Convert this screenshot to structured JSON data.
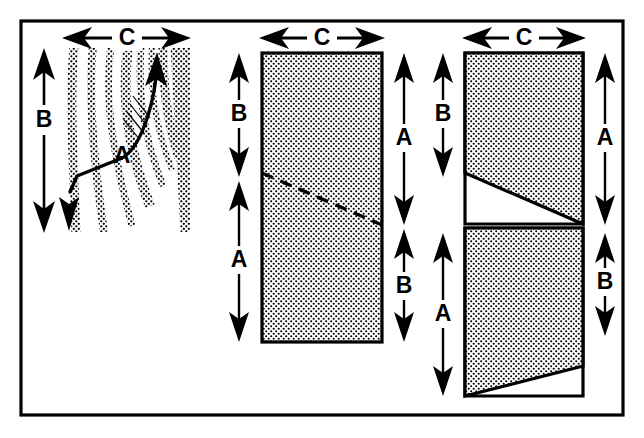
{
  "figure": {
    "title": "",
    "frame": {
      "stroke_color": "#000000",
      "fill_color": "#ffffff"
    },
    "colors": {
      "ink": "#000000",
      "paper": "#ffffff",
      "stipple": "#000000",
      "stipple_bg": "#ffffff"
    },
    "panels": [
      {
        "id": "panel-1",
        "name": "log-cross-section",
        "description": "Stippled end-grain texture of a log with a curved arrow indicating ray/grain direction",
        "labels": {
          "width_dimension": "C",
          "height_dimension": "B",
          "callout": "A"
        },
        "dimension_arrows": [
          {
            "name": "width-arrow-c",
            "label": "C",
            "orientation": "horizontal",
            "heads": "both"
          },
          {
            "name": "height-arrow-b",
            "label": "B",
            "orientation": "vertical",
            "heads": "both"
          }
        ],
        "grain_arrow": {
          "name": "grain-arrow-a",
          "label": "A",
          "style": "curved",
          "heads": "end"
        }
      },
      {
        "id": "panel-2",
        "name": "single-board-dashed-split",
        "description": "One stippled rectangle with a dashed diagonal split line",
        "labels": {
          "width_dimension": "C",
          "left_top": "B",
          "left_bottom": "A",
          "right_top": "A",
          "right_bottom": "B"
        },
        "split_line_style": "dashed",
        "dimension_arrows": [
          {
            "name": "width-arrow-c",
            "label": "C",
            "orientation": "horizontal",
            "heads": "both"
          },
          {
            "name": "left-arrow-b",
            "label": "B",
            "orientation": "vertical",
            "heads": "both"
          },
          {
            "name": "left-arrow-a",
            "label": "A",
            "orientation": "vertical",
            "heads": "both"
          },
          {
            "name": "right-arrow-a",
            "label": "A",
            "orientation": "vertical",
            "heads": "both"
          },
          {
            "name": "right-arrow-b",
            "label": "B",
            "orientation": "vertical",
            "heads": "both"
          }
        ]
      },
      {
        "id": "panel-3",
        "name": "two-boards-solid-split",
        "description": "Two stacked stippled trapezoids separated by solid diagonal cuts",
        "labels": {
          "width_dimension": "C",
          "left_top": "B",
          "left_bottom": "A",
          "right_top": "A",
          "right_bottom": "B"
        },
        "split_line_style": "solid",
        "dimension_arrows": [
          {
            "name": "width-arrow-c",
            "label": "C",
            "orientation": "horizontal",
            "heads": "both"
          },
          {
            "name": "left-arrow-b",
            "label": "B",
            "orientation": "vertical",
            "heads": "both"
          },
          {
            "name": "left-arrow-a",
            "label": "A",
            "orientation": "vertical",
            "heads": "both"
          },
          {
            "name": "right-arrow-a",
            "label": "A",
            "orientation": "vertical",
            "heads": "both"
          },
          {
            "name": "right-arrow-b",
            "label": "B",
            "orientation": "vertical",
            "heads": "both"
          }
        ]
      }
    ]
  }
}
